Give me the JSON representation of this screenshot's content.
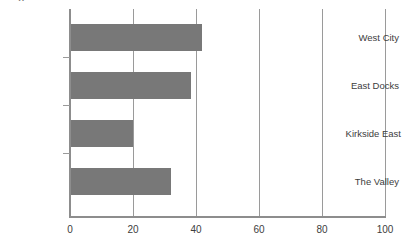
{
  "title_fragment": "Figure",
  "chart_data": {
    "type": "bar",
    "orientation": "horizontal",
    "title": "",
    "xlabel": "",
    "ylabel": "",
    "categories": [
      "West City",
      "East Docks",
      "Kirkside East",
      "The Valley"
    ],
    "values": [
      42,
      38.5,
      20,
      32
    ],
    "series": [
      {
        "name": "",
        "values": [
          42,
          38.5,
          20,
          32
        ]
      }
    ],
    "xlim": [
      0,
      100
    ],
    "xticks": [
      0,
      20,
      40,
      60,
      80,
      100
    ],
    "xtick_labels": [
      "0",
      "20",
      "40",
      "60",
      "80",
      "100"
    ],
    "grid": "vertical",
    "legend": "none",
    "bar_color": "#787878",
    "axis_color": "#8d8d8d",
    "gridline_color": "#9a9a9a"
  }
}
